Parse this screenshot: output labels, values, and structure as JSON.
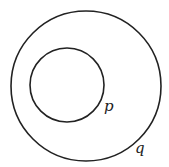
{
  "diagram": {
    "type": "nested-circles",
    "outer": {
      "label": "q",
      "cx": 86,
      "cy": 86,
      "r": 75
    },
    "inner": {
      "label": "p",
      "cx": 67,
      "cy": 85,
      "r": 37
    },
    "stroke_color": "#222222"
  }
}
